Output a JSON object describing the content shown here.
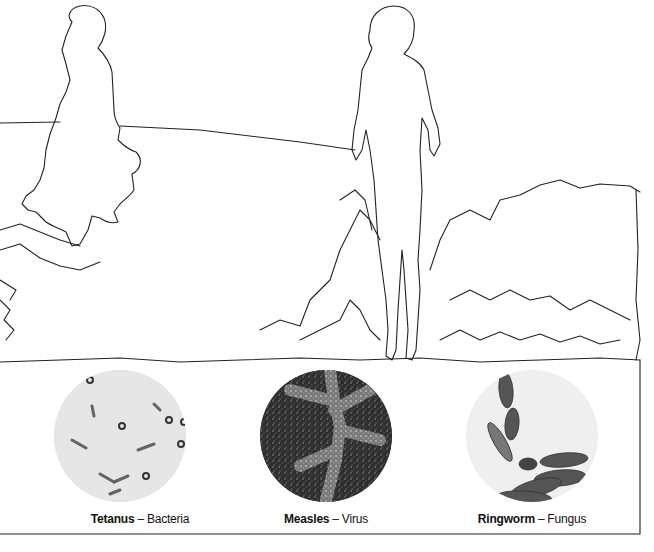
{
  "illustration": {
    "description": "Line-art silhouettes of two children in an outdoor landscape, with three microscope views of pathogens below"
  },
  "specimens": [
    {
      "name": "Tetanus",
      "separator": "–",
      "type": "Bacteria",
      "appearance": "pale grey field with dark rod-shaped cells and ring spores"
    },
    {
      "name": "Measles",
      "separator": "–",
      "type": "Virus",
      "appearance": "dark speckled field with lighter branching pattern"
    },
    {
      "name": "Ringworm",
      "separator": "–",
      "type": "Fungus",
      "appearance": "light field with dark segmented spindle-shaped spores"
    }
  ],
  "colors": {
    "line": "#222222",
    "background": "#ffffff",
    "tetanus_bg": "#e6e6e6",
    "measles_bg": "#3a3a3a",
    "ringworm_bg": "#efefef"
  }
}
